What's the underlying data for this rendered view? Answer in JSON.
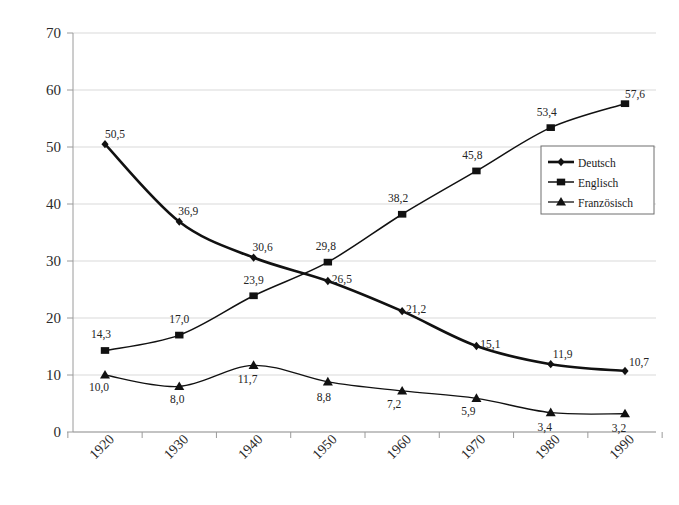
{
  "chart_data": {
    "type": "line",
    "title": "",
    "subtitle": "",
    "xlabel": "",
    "ylabel": "",
    "categories": [
      "1920",
      "1930",
      "1940",
      "1950",
      "1960",
      "1970",
      "1980",
      "1990"
    ],
    "ylim": [
      0,
      70
    ],
    "ytick_labels": [
      "0",
      "10",
      "20",
      "30",
      "40",
      "50",
      "60",
      "70"
    ],
    "ytick_values": [
      0,
      10,
      20,
      30,
      40,
      50,
      60,
      70
    ],
    "grid": "horizontal",
    "legend_position": "right-middle",
    "decimal_separator": ",",
    "series": [
      {
        "name": "Deutsch",
        "marker": "diamond",
        "color": "#111111",
        "line_width": 2.6,
        "values": [
          50.5,
          36.9,
          30.6,
          26.5,
          21.2,
          15.1,
          11.9,
          10.7
        ],
        "labels": [
          "50,5",
          "36,9",
          "30,6",
          "26,5",
          "21,2",
          "15,1",
          "11,9",
          "10,7"
        ]
      },
      {
        "name": "Englisch",
        "marker": "square",
        "color": "#111111",
        "line_width": 1.5,
        "values": [
          14.3,
          17.0,
          23.9,
          29.8,
          38.2,
          45.8,
          53.4,
          57.6
        ],
        "labels": [
          "14,3",
          "17,0",
          "23,9",
          "29,8",
          "38,2",
          "45,8",
          "53,4",
          "57,6"
        ]
      },
      {
        "name": "Französisch",
        "marker": "triangle",
        "color": "#111111",
        "line_width": 1.3,
        "values": [
          10.0,
          8.0,
          11.7,
          8.8,
          7.2,
          5.9,
          3.4,
          3.2
        ],
        "labels": [
          "10,0",
          "8,0",
          "11,7",
          "8,8",
          "7,2",
          "5,9",
          "3,4",
          "3,2"
        ]
      }
    ],
    "label_offsets": {
      "Deutsch": [
        [
          10,
          -6
        ],
        [
          9,
          -7
        ],
        [
          9,
          -7
        ],
        [
          14,
          2
        ],
        [
          14,
          2
        ],
        [
          14,
          2
        ],
        [
          12,
          -6
        ],
        [
          14,
          -5
        ]
      ],
      "Englisch": [
        [
          -4,
          -12
        ],
        [
          0,
          -12
        ],
        [
          0,
          -12
        ],
        [
          -2,
          -12
        ],
        [
          -4,
          -12
        ],
        [
          -4,
          -12
        ],
        [
          -4,
          -12
        ],
        [
          10,
          -6
        ]
      ],
      "Französisch": [
        [
          -6,
          16
        ],
        [
          -2,
          17
        ],
        [
          -6,
          18
        ],
        [
          -4,
          19
        ],
        [
          -8,
          17
        ],
        [
          -8,
          17
        ],
        [
          -6,
          18
        ],
        [
          -6,
          18
        ]
      ]
    },
    "colors": {
      "background": "#ffffff",
      "grid": "#d9d9d9",
      "axis": "#9a9a9a",
      "series": "#111111",
      "text": "#242424",
      "legend_border": "#6e6e6e"
    }
  }
}
